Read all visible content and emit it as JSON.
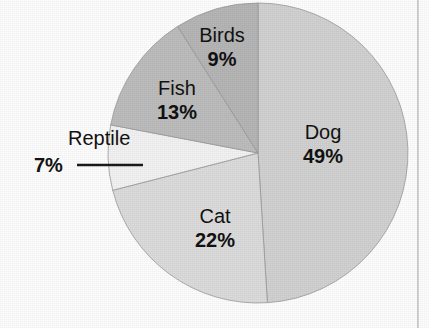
{
  "chart_data": {
    "type": "pie",
    "title": "",
    "subtitle": "",
    "xlabel": "",
    "ylabel": "",
    "legend_position": "none",
    "grid": false,
    "units": "percent",
    "total": 100,
    "categories": [
      "Dog",
      "Cat",
      "Reptile",
      "Fish",
      "Birds"
    ],
    "values": [
      49,
      22,
      7,
      13,
      9
    ],
    "labels": [
      "49%",
      "22%",
      "7%",
      "13%",
      "9%"
    ],
    "start_angle_deg": 0,
    "direction": "clockwise",
    "slices": [
      {
        "name": "Dog",
        "value": 49,
        "value_label": "49%",
        "color": "#d2d2d2",
        "start_deg": 0,
        "end_deg": 176.4,
        "label_placement": "inside",
        "label_x": 323,
        "label_y": 139,
        "pct_x": 323,
        "pct_y": 163
      },
      {
        "name": "Cat",
        "value": 22,
        "value_label": "22%",
        "color": "#dcdcdc",
        "start_deg": 176.4,
        "end_deg": 255.6,
        "label_placement": "inside",
        "label_x": 215,
        "label_y": 223,
        "pct_x": 215,
        "pct_y": 247
      },
      {
        "name": "Reptile",
        "value": 7,
        "value_label": "7%",
        "color": "#f3f3f3",
        "start_deg": 255.6,
        "end_deg": 280.8,
        "label_placement": "callout",
        "label_x": 68,
        "label_y": 145,
        "pct_x": 34,
        "pct_y": 172,
        "callout": {
          "x1": 77,
          "y1": 165,
          "x2": 143,
          "y2": 165
        }
      },
      {
        "name": "Fish",
        "value": 13,
        "value_label": "13%",
        "color": "#bdbdbd",
        "start_deg": 280.8,
        "end_deg": 327.6,
        "label_placement": "inside",
        "label_x": 177,
        "label_y": 95,
        "pct_x": 177,
        "pct_y": 119
      },
      {
        "name": "Birds",
        "value": 9,
        "value_label": "9%",
        "color": "#b6b6b6",
        "start_deg": 327.6,
        "end_deg": 360,
        "label_placement": "inside",
        "label_x": 222,
        "label_y": 42,
        "pct_x": 222,
        "pct_y": 66
      }
    ],
    "geometry": {
      "cx": 258,
      "cy": 153,
      "r": 150
    }
  },
  "figure": {
    "background_color": "#fefefe",
    "page_rule_color": "#b4b4b4"
  }
}
